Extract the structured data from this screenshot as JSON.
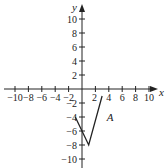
{
  "chart_data": {
    "type": "line",
    "title": "",
    "xlabel": "x",
    "ylabel": "y",
    "xlim": [
      -11,
      11
    ],
    "ylim": [
      -11,
      11
    ],
    "grid": false,
    "x_ticks": [
      -10,
      -8,
      -6,
      -4,
      -2,
      2,
      4,
      6,
      8,
      10
    ],
    "y_ticks": [
      10,
      8,
      6,
      4,
      2,
      -2,
      -4,
      -6,
      -8,
      -10
    ],
    "x_tick_labels": [
      "−10",
      "−8",
      "−6",
      "−4",
      "−2",
      "2",
      "4",
      "6",
      "8",
      "10"
    ],
    "y_tick_labels": [
      "10",
      "8",
      "6",
      "4",
      "2",
      "−2",
      "−4",
      "−6",
      "−8",
      "−10"
    ],
    "series": [
      {
        "name": "A",
        "points": [
          [
            -1,
            -4
          ],
          [
            1,
            -8
          ],
          [
            3,
            -1
          ]
        ]
      }
    ],
    "annotations": [
      {
        "text": "A",
        "x": 4,
        "y": -4
      }
    ]
  }
}
